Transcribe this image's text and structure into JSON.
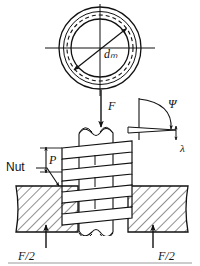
{
  "figure": {
    "background_color": "#ffffff",
    "line_color": "#111111",
    "hatch_color": "#222222"
  },
  "cross_section": {
    "name": "screw-cross-section",
    "center": [
      100,
      48
    ],
    "outer_radius": 41,
    "mid_radius": 36,
    "dashed_pitch_radius": 33,
    "inner_radius": 29,
    "axes": {
      "vertical": true,
      "horizontal": true
    },
    "dimension": {
      "label": "dₘ",
      "label_text": "d",
      "subscript": "m",
      "from": [
        126,
        28
      ],
      "to": [
        74,
        70
      ],
      "arrow_both_ends": true
    }
  },
  "side_view": {
    "name": "screw-side-view",
    "force_label": "F",
    "force_arrow": {
      "from": [
        101,
        92
      ],
      "to": [
        101,
        126
      ],
      "direction": "down"
    },
    "nut_label": "Nut",
    "pitch_label": "P",
    "helix_angle_label": "Ψ",
    "lead_label": "λ",
    "reaction_left_label": "F/2",
    "reaction_right_label": "F/2",
    "reaction_left_arrow": {
      "from": [
        60,
        246
      ],
      "to": [
        60,
        224
      ],
      "direction": "up"
    },
    "reaction_right_arrow": {
      "from": [
        153,
        246
      ],
      "to": [
        153,
        224
      ],
      "direction": "up"
    },
    "thread_count": 5,
    "thread_slab_angle_deg": -9
  },
  "annotations": [
    {
      "name": "label-dm",
      "text": "dₘ",
      "role": "mean-diameter"
    },
    {
      "name": "label-F",
      "text": "F",
      "role": "applied-load"
    },
    {
      "name": "label-Nut",
      "text": "Nut",
      "role": "part-name"
    },
    {
      "name": "label-P",
      "text": "P",
      "role": "pitch"
    },
    {
      "name": "label-Psi",
      "text": "Ψ",
      "role": "helix-angle"
    },
    {
      "name": "label-lambda",
      "text": "λ",
      "role": "lead-angle"
    },
    {
      "name": "label-F2-left",
      "text": "F/2",
      "role": "reaction-force"
    },
    {
      "name": "label-F2-right",
      "text": "F/2",
      "role": "reaction-force"
    }
  ],
  "footer_rule": {
    "name": "bottom-rule",
    "y": 261
  }
}
